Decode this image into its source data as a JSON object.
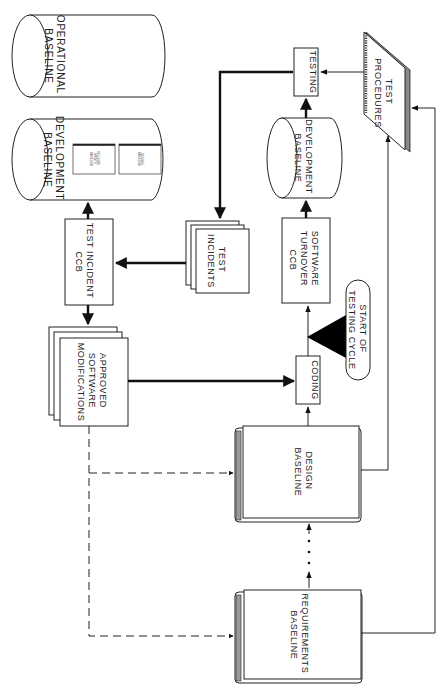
{
  "diagram": {
    "orientation": "rotated-90-clockwise",
    "nodes": {
      "operational_baseline": {
        "line1": "OPERATIONAL",
        "line2": "BASELINE",
        "shape": "cylinder"
      },
      "development_baseline_top": {
        "line1": "DEVELOPMENT",
        "line2": "BASELINE",
        "shape": "cylinder",
        "contents": [
          {
            "line1": "REQUIRE-",
            "line2": "MENTS",
            "line3": "BASELINE"
          },
          {
            "line1": "DESIGN",
            "line2": "BASELINE"
          }
        ]
      },
      "equals_sign": "=",
      "test_incident_ccb": {
        "line1": "TEST INCIDENT",
        "line2": "CCB",
        "shape": "box"
      },
      "test_incidents": {
        "line1": "TEST",
        "line2": "INCIDENTS",
        "shape": "stacked-documents"
      },
      "approved_software_modifications": {
        "line1": "APPROVED",
        "line2": "SOFTWARE",
        "line3": "MODIFICATIONS",
        "shape": "stacked-documents"
      },
      "testing": {
        "label": "TESTING",
        "shape": "box"
      },
      "development_baseline_mid": {
        "line1": "DEVELOPMENT",
        "line2": "BASELINE",
        "shape": "cylinder"
      },
      "test_procedures": {
        "line1": "TEST",
        "line2": "PROCEDURES",
        "shape": "spiral-notebook"
      },
      "software_turnover_ccb": {
        "line1": "SOFTWARE",
        "line2": "TURNOVER",
        "line3": "CCB",
        "shape": "box"
      },
      "coding": {
        "label": "CODING",
        "shape": "box"
      },
      "start_of_testing_cycle": {
        "line1": "START OF",
        "line2": "TESTING CYCLE",
        "shape": "rounded-pill"
      },
      "design_baseline": {
        "line1": "DESIGN",
        "line2": "BASELINE",
        "shape": "book"
      },
      "requirements_baseline": {
        "line1": "REQUIREMENTS",
        "line2": "BASELINE",
        "shape": "book"
      }
    },
    "edges": [
      {
        "from": "test_incident_ccb",
        "to": "development_baseline_top",
        "style": "thick"
      },
      {
        "from": "test_incident_ccb",
        "to": "approved_software_modifications",
        "style": "thick"
      },
      {
        "from": "test_incidents",
        "to": "test_incident_ccb",
        "style": "thick"
      },
      {
        "from": "testing",
        "to": "test_incidents",
        "style": "thick"
      },
      {
        "from": "approved_software_modifications",
        "to": "coding",
        "style": "thick"
      },
      {
        "from": "approved_software_modifications",
        "to": "design_baseline",
        "style": "dashed"
      },
      {
        "from": "approved_software_modifications",
        "to": "requirements_baseline",
        "style": "dashed"
      },
      {
        "from": "requirements_baseline",
        "to": "design_baseline",
        "style": "dotted"
      },
      {
        "from": "design_baseline",
        "to": "coding",
        "style": "thin"
      },
      {
        "from": "coding",
        "to": "software_turnover_ccb",
        "style": "thin"
      },
      {
        "from": "start_of_testing_cycle",
        "to": "coding-software_turnover_ccb",
        "style": "big-arrow"
      },
      {
        "from": "software_turnover_ccb",
        "to": "development_baseline_mid",
        "style": "thick"
      },
      {
        "from": "development_baseline_mid",
        "to": "testing",
        "style": "thick"
      },
      {
        "from": "test_procedures",
        "to": "testing",
        "style": "thin"
      },
      {
        "from": "design_baseline",
        "to": "test_procedures",
        "style": "thin"
      },
      {
        "from": "requirements_baseline",
        "to": "test_procedures",
        "style": "thin"
      }
    ]
  }
}
